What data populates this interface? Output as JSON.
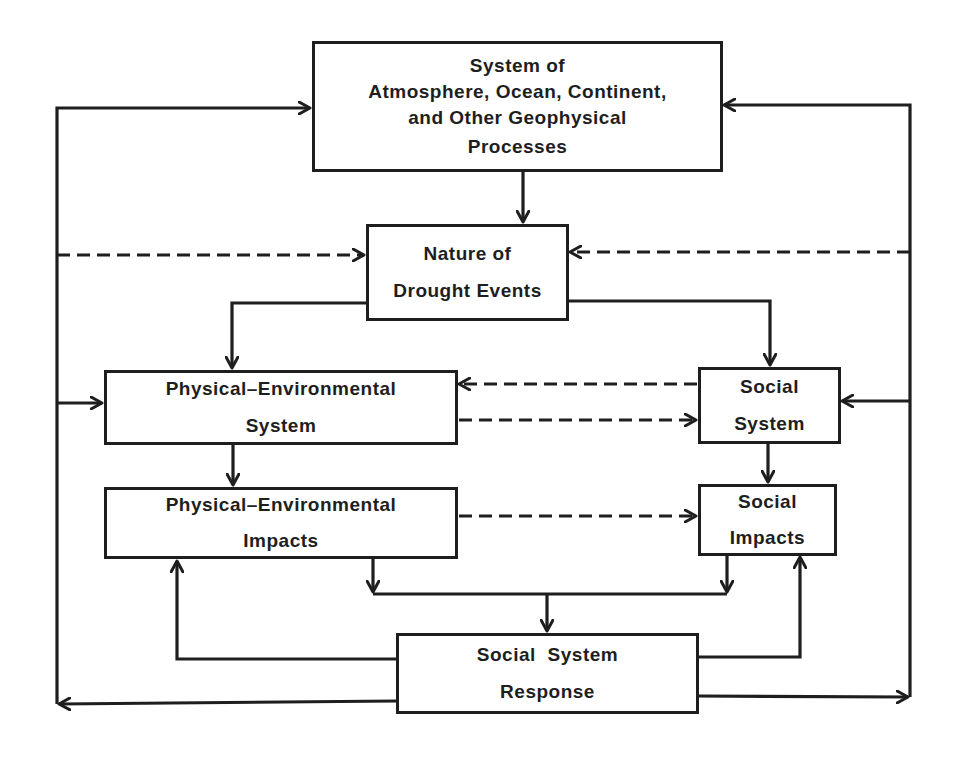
{
  "diagram": {
    "type": "flowchart",
    "nodes": {
      "geophysical": {
        "lines": [
          "System of",
          "Atmosphere, Ocean, Continent,",
          "and Other Geophysical",
          "Processes"
        ]
      },
      "drought": {
        "lines": [
          "Nature of",
          "Drought Events"
        ]
      },
      "phys_env_system": {
        "lines": [
          "Physical–Environmental",
          "System"
        ]
      },
      "social_system": {
        "lines": [
          "Social",
          "System"
        ]
      },
      "phys_env_impacts": {
        "lines": [
          "Physical–Environmental",
          "Impacts"
        ]
      },
      "social_impacts": {
        "lines": [
          "Social",
          "Impacts"
        ]
      },
      "response": {
        "lines": [
          "Social System",
          "Response"
        ]
      }
    },
    "edges": [
      {
        "from": "geophysical",
        "to": "drought",
        "style": "solid"
      },
      {
        "from": "drought",
        "to": "phys_env_system",
        "style": "solid"
      },
      {
        "from": "drought",
        "to": "social_system",
        "style": "solid"
      },
      {
        "from": "phys_env_system",
        "to": "social_system",
        "style": "dashed"
      },
      {
        "from": "social_system",
        "to": "phys_env_system",
        "style": "dashed"
      },
      {
        "from": "phys_env_system",
        "to": "phys_env_impacts",
        "style": "solid"
      },
      {
        "from": "social_system",
        "to": "social_impacts",
        "style": "solid"
      },
      {
        "from": "phys_env_impacts",
        "to": "social_impacts",
        "style": "dashed"
      },
      {
        "from": "phys_env_impacts",
        "to": "response",
        "style": "solid"
      },
      {
        "from": "social_impacts",
        "to": "response",
        "style": "solid"
      },
      {
        "from": "response",
        "to": "phys_env_impacts",
        "style": "solid"
      },
      {
        "from": "response",
        "to": "social_impacts",
        "style": "solid"
      },
      {
        "from": "response",
        "to": "geophysical",
        "style": "solid",
        "via": "left-rail"
      },
      {
        "from": "response",
        "to": "geophysical",
        "style": "solid",
        "via": "right-rail"
      },
      {
        "from": "response",
        "to": "drought",
        "style": "dashed",
        "via": "left-rail"
      },
      {
        "from": "response",
        "to": "drought",
        "style": "dashed",
        "via": "right-rail"
      },
      {
        "from": "response",
        "to": "phys_env_system",
        "style": "solid",
        "via": "left-rail"
      },
      {
        "from": "response",
        "to": "social_system",
        "style": "solid",
        "via": "right-rail"
      }
    ],
    "colors": {
      "ink": "#1e1e1e",
      "background": "#ffffff"
    }
  }
}
